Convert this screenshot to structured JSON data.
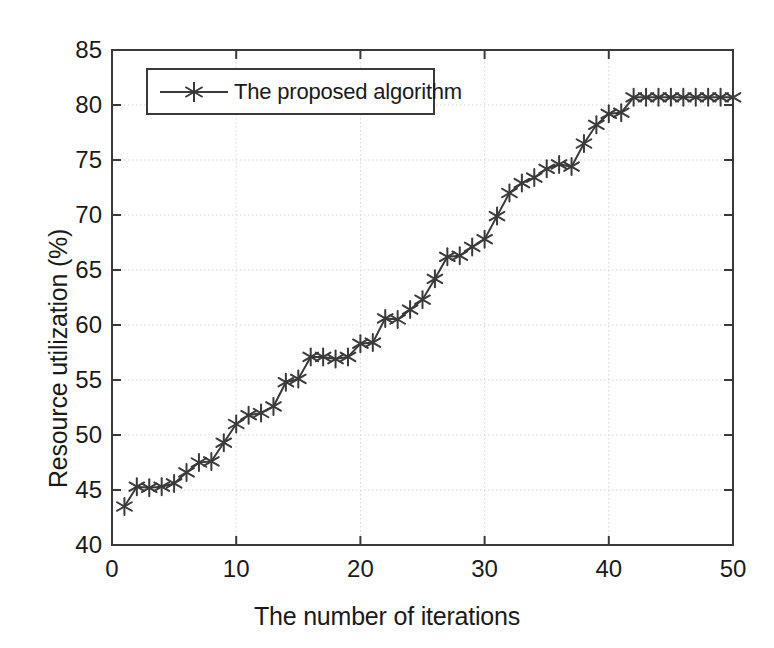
{
  "chart_data": {
    "type": "line",
    "title": "",
    "xlabel": "The number of iterations",
    "ylabel": "Resource utilization (%)",
    "xlim": [
      0,
      50
    ],
    "ylim": [
      40,
      85
    ],
    "xticks": [
      0,
      10,
      20,
      30,
      40,
      50
    ],
    "yticks": [
      40,
      45,
      50,
      55,
      60,
      65,
      70,
      75,
      80,
      85
    ],
    "grid": true,
    "legend_position": "upper left",
    "marker": "star",
    "line_color": "#3a3a3a",
    "series": [
      {
        "name": "The proposed algorithm",
        "x": [
          1,
          2,
          3,
          4,
          5,
          6,
          7,
          8,
          9,
          10,
          11,
          12,
          13,
          14,
          15,
          16,
          17,
          18,
          19,
          20,
          21,
          22,
          23,
          24,
          25,
          26,
          27,
          28,
          29,
          30,
          31,
          32,
          33,
          34,
          35,
          36,
          37,
          38,
          39,
          40,
          41,
          42,
          43,
          44,
          45,
          46,
          47,
          48,
          49,
          50
        ],
        "values": [
          43.5,
          45.3,
          45.2,
          45.3,
          45.6,
          46.6,
          47.5,
          47.6,
          49.3,
          51.0,
          51.8,
          52.0,
          52.6,
          54.8,
          55.1,
          57.1,
          57.1,
          56.9,
          57.1,
          58.3,
          58.4,
          60.6,
          60.5,
          61.4,
          62.3,
          64.2,
          66.2,
          66.3,
          67.1,
          67.8,
          69.9,
          72.0,
          72.9,
          73.4,
          74.2,
          74.6,
          74.4,
          76.5,
          78.2,
          79.2,
          79.3,
          80.7,
          80.7,
          80.7,
          80.7,
          80.7,
          80.7,
          80.7,
          80.7,
          80.7
        ]
      }
    ]
  },
  "legend": {
    "label": "The proposed algorithm"
  },
  "axes": {
    "x_tick_labels": [
      "0",
      "10",
      "20",
      "30",
      "40",
      "50"
    ],
    "y_tick_labels": [
      "40",
      "45",
      "50",
      "55",
      "60",
      "65",
      "70",
      "75",
      "80",
      "85"
    ],
    "x_title": "The number of iterations",
    "y_title": "Resource utilization (%)"
  }
}
